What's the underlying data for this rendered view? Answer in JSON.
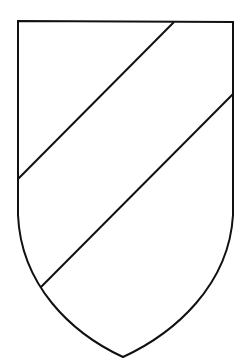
{
  "diagram": {
    "type": "heraldic-shield",
    "division": "bend-sinister-pair",
    "colors": {
      "background": "#ffffff",
      "field": "#ffffff",
      "outline": "#111111"
    },
    "shield": {
      "top_left": [
        18,
        21
      ],
      "top_right": [
        233,
        22
      ],
      "sides_straight_until_y": 215,
      "bottom_point": [
        123,
        357
      ]
    },
    "lines": [
      {
        "name": "upper-bend-line",
        "from": [
          174,
          22
        ],
        "to": [
          18,
          179
        ]
      },
      {
        "name": "lower-bend-line",
        "from": [
          233,
          94
        ],
        "to": [
          41,
          287
        ]
      }
    ],
    "regions": [
      {
        "name": "upper-left-segment"
      },
      {
        "name": "middle-band"
      },
      {
        "name": "lower-right-segment"
      }
    ]
  }
}
